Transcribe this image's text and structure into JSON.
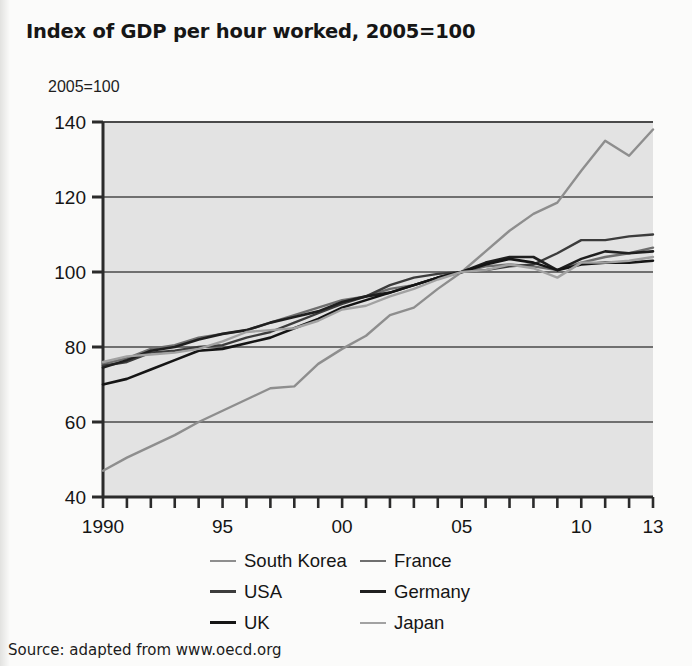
{
  "figure": {
    "title": "Index of GDP per hour worked, 2005=100",
    "axis_note": "2005=100",
    "source": "Source: adapted from www.oecd.org",
    "page_background": "#fbfbfa",
    "plot_background": "#e3e3e3",
    "axis_color": "#2b2b2b",
    "gridline_color": "#4a4a4a"
  },
  "chart_data": {
    "type": "line",
    "title": "Index of GDP per hour worked, 2005=100",
    "xlabel": "",
    "ylabel": "2005=100",
    "ylim": [
      40,
      140
    ],
    "xlim": [
      1990,
      2013
    ],
    "yticks": [
      40,
      60,
      80,
      100,
      120,
      140
    ],
    "ytick_labels": [
      "40",
      "60",
      "80",
      "100",
      "120",
      "140"
    ],
    "xticks": [
      1990,
      1991,
      1992,
      1993,
      1994,
      1995,
      1996,
      1997,
      1998,
      1999,
      2000,
      2001,
      2002,
      2003,
      2004,
      2005,
      2006,
      2007,
      2008,
      2009,
      2010,
      2011,
      2012,
      2013
    ],
    "xtick_labels": {
      "1990": "1990",
      "1995": "95",
      "2000": "00",
      "2005": "05",
      "2010": "10",
      "2013": "13"
    },
    "grid": "horizontal",
    "legend_position": "below",
    "x": [
      1990,
      1991,
      1992,
      1993,
      1994,
      1995,
      1996,
      1997,
      1998,
      1999,
      2000,
      2001,
      2002,
      2003,
      2004,
      2005,
      2006,
      2007,
      2008,
      2009,
      2010,
      2011,
      2012,
      2013
    ],
    "series": [
      {
        "name": "South Korea",
        "color": "#8e8e8e",
        "width": 2.4,
        "values": [
          47.0,
          50.5,
          53.5,
          56.5,
          60.0,
          63.0,
          66.0,
          69.0,
          69.5,
          75.5,
          79.5,
          83.0,
          88.5,
          90.5,
          95.5,
          100.0,
          105.5,
          111.0,
          115.5,
          118.5,
          127.0,
          135.0,
          131.0,
          138.0
        ]
      },
      {
        "name": "France",
        "color": "#6f6f6f",
        "width": 2.4,
        "values": [
          75.5,
          77.0,
          79.5,
          80.5,
          82.5,
          83.5,
          84.5,
          86.5,
          88.5,
          90.5,
          92.5,
          93.5,
          95.5,
          96.5,
          98.5,
          100.0,
          101.5,
          102.0,
          101.5,
          100.5,
          102.5,
          104.0,
          105.0,
          106.5
        ]
      },
      {
        "name": "USA",
        "color": "#3c3c3c",
        "width": 2.4,
        "values": [
          75.0,
          76.0,
          78.5,
          79.0,
          80.0,
          80.5,
          82.5,
          84.0,
          86.5,
          89.0,
          91.5,
          93.5,
          96.5,
          98.5,
          99.5,
          100.0,
          100.5,
          101.5,
          102.0,
          105.0,
          108.5,
          108.5,
          109.5,
          110.0
        ]
      },
      {
        "name": "Germany",
        "color": "#1f1f1f",
        "width": 2.6,
        "values": [
          74.5,
          76.5,
          79.0,
          80.0,
          82.0,
          83.5,
          84.5,
          86.5,
          88.0,
          89.5,
          92.0,
          93.5,
          94.5,
          96.5,
          98.5,
          100.0,
          102.5,
          104.0,
          104.0,
          100.5,
          103.5,
          105.5,
          105.0,
          105.5
        ]
      },
      {
        "name": "UK",
        "color": "#151515",
        "width": 2.6,
        "values": [
          70.0,
          71.5,
          74.0,
          76.5,
          79.0,
          79.5,
          81.0,
          82.5,
          85.0,
          87.5,
          90.5,
          92.5,
          94.5,
          96.5,
          98.5,
          100.0,
          102.0,
          103.5,
          102.5,
          100.5,
          102.0,
          102.5,
          102.5,
          103.0
        ]
      },
      {
        "name": "Japan",
        "color": "#a2a2a2",
        "width": 2.4,
        "values": [
          76.0,
          77.5,
          78.0,
          78.5,
          79.5,
          81.5,
          84.0,
          84.5,
          85.0,
          87.0,
          90.0,
          91.0,
          93.5,
          95.5,
          98.0,
          100.0,
          100.5,
          102.0,
          101.0,
          98.5,
          102.5,
          102.5,
          103.0,
          104.0
        ]
      }
    ]
  },
  "legend": {
    "items": [
      {
        "label": "South Korea",
        "color": "#8e8e8e",
        "width": 2.4
      },
      {
        "label": "France",
        "color": "#6f6f6f",
        "width": 2.6
      },
      {
        "label": "USA",
        "color": "#3c3c3c",
        "width": 3.0
      },
      {
        "label": "Germany",
        "color": "#1f1f1f",
        "width": 3.4
      },
      {
        "label": "UK",
        "color": "#151515",
        "width": 3.4
      },
      {
        "label": "Japan",
        "color": "#a2a2a2",
        "width": 2.4
      }
    ]
  }
}
